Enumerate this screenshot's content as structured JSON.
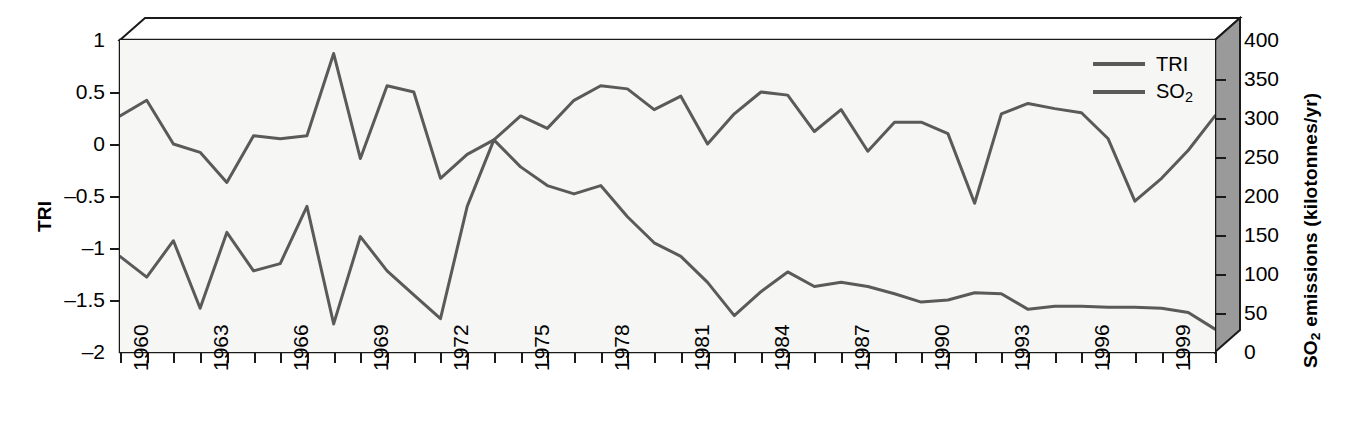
{
  "axes": {
    "left_title": "TRI",
    "right_title_pre": "SO",
    "right_title_sub": "2",
    "right_title_post": " emissions (kilotonnes/yr)",
    "left_ticks": [
      "1",
      "0.5",
      "0",
      "–0.5",
      "–1",
      "–1.5",
      "–2"
    ],
    "right_ticks": [
      "400",
      "350",
      "300",
      "250",
      "200",
      "150",
      "100",
      "50",
      "0"
    ],
    "x_ticks": [
      "1960",
      "1963",
      "1966",
      "1969",
      "1972",
      "1975",
      "1978",
      "1981",
      "1984",
      "1987",
      "1990",
      "1993",
      "1996",
      "1999"
    ]
  },
  "legend": {
    "items": [
      {
        "label": "TRI",
        "label_sub": "",
        "color": "#5a5a5a"
      },
      {
        "label": "SO",
        "label_sub": "2",
        "color": "#5a5a5a"
      }
    ]
  },
  "colors": {
    "tri_line": "#5a5a5a",
    "so2_line": "#5a5a5a",
    "plot_bg": "#f6f6f4",
    "frame_top": "#ffffff",
    "frame_side": "#9a9a9a",
    "axis": "#1a1a1a"
  },
  "chart_data": {
    "type": "line",
    "title": "",
    "xlabel": "",
    "ylabel": "TRI",
    "y2label": "SO2 emissions (kilotonnes/yr)",
    "ylim": [
      -2,
      1
    ],
    "y2lim": [
      0,
      400
    ],
    "xlim": [
      1960,
      2001
    ],
    "grid": false,
    "legend_position": "top-right",
    "x": [
      1960,
      1961,
      1962,
      1963,
      1964,
      1965,
      1966,
      1967,
      1968,
      1969,
      1970,
      1971,
      1972,
      1973,
      1974,
      1975,
      1976,
      1977,
      1978,
      1979,
      1980,
      1981,
      1982,
      1983,
      1984,
      1985,
      1986,
      1987,
      1988,
      1989,
      1990,
      1991,
      1992,
      1993,
      1994,
      1995,
      1996,
      1997,
      1998,
      1999,
      2000,
      2001
    ],
    "series": [
      {
        "name": "TRI",
        "axis": "left",
        "color": "#5a5a5a",
        "values": [
          0.27,
          0.42,
          0.0,
          -0.08,
          -0.37,
          0.08,
          0.05,
          0.08,
          0.87,
          -0.14,
          0.56,
          0.5,
          -0.33,
          -0.1,
          0.04,
          0.27,
          0.15,
          0.42,
          0.56,
          0.53,
          0.33,
          0.46,
          0.0,
          0.29,
          0.5,
          0.47,
          0.12,
          0.33,
          -0.07,
          0.21,
          0.21,
          0.1,
          -0.57,
          0.29,
          0.39,
          0.34,
          0.3,
          0.05,
          -0.55,
          -0.33,
          -0.06,
          0.27
        ]
      },
      {
        "name": "SO2",
        "axis": "right",
        "color": "#5a5a5a",
        "units": "kilotonnes/yr",
        "values_tri_scale": [
          -1.08,
          -1.28,
          -0.93,
          -1.58,
          -0.85,
          -1.22,
          -1.15,
          -0.6,
          -1.73,
          -0.89,
          -1.22,
          -1.45,
          -1.68,
          -0.6,
          0.04,
          -0.22,
          -0.4,
          -0.48,
          -0.4,
          -0.7,
          -0.95,
          -1.08,
          -1.33,
          -1.65,
          -1.42,
          -1.23,
          -1.37,
          -1.33,
          -1.37,
          -1.44,
          -1.52,
          -1.5,
          -1.43,
          -1.44,
          -1.59,
          -1.56,
          -1.56,
          -1.57,
          -1.57,
          -1.58,
          -1.62,
          -1.78
        ],
        "values_kt": [
          123,
          96,
          143,
          56,
          153,
          104,
          113,
          187,
          36,
          148,
          104,
          73,
          43,
          187,
          272,
          237,
          213,
          203,
          213,
          173,
          140,
          123,
          89,
          47,
          77,
          103,
          84,
          89,
          84,
          75,
          64,
          67,
          76,
          75,
          55,
          59,
          59,
          57,
          57,
          56,
          51,
          29
        ]
      }
    ]
  }
}
